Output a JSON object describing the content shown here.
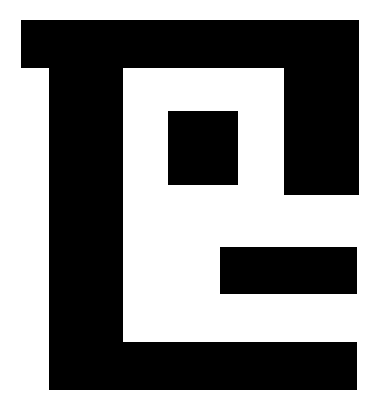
{
  "logo": {
    "name": "geometric-block-logo",
    "foreground_color": "#000000",
    "background_color": "#ffffff",
    "blocks": [
      {
        "id": "top-bar",
        "x": 21,
        "y": 20,
        "w": 338,
        "h": 48
      },
      {
        "id": "left-stem",
        "x": 49,
        "y": 20,
        "w": 74,
        "h": 370
      },
      {
        "id": "right-column",
        "x": 284,
        "y": 20,
        "w": 75,
        "h": 175
      },
      {
        "id": "inner-square",
        "x": 168,
        "y": 111,
        "w": 70,
        "h": 74
      },
      {
        "id": "middle-bar",
        "x": 220,
        "y": 247,
        "w": 137,
        "h": 47
      },
      {
        "id": "bottom-bar",
        "x": 49,
        "y": 342,
        "w": 308,
        "h": 48
      }
    ]
  }
}
